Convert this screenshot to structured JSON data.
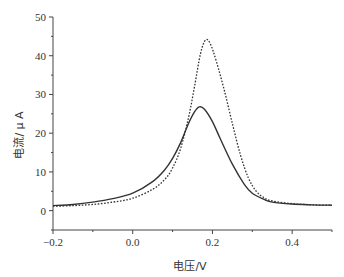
{
  "chart_data": {
    "type": "line",
    "title": "",
    "xlabel": "电压/V",
    "ylabel": "电流/ μ A",
    "xlim": [
      -0.2,
      0.5
    ],
    "ylim": [
      -5,
      50
    ],
    "grid": false,
    "legend": null,
    "x_major_ticks": [
      -0.2,
      0.0,
      0.2,
      0.4
    ],
    "x_major_tick_labels": [
      "-0.2",
      "0.0",
      "0.2",
      "0.4"
    ],
    "x_minor_ticks": [
      -0.1,
      0.1,
      0.3,
      0.5
    ],
    "y_major_ticks": [
      0,
      10,
      20,
      30,
      40,
      50
    ],
    "y_major_tick_labels": [
      "0",
      "10",
      "20",
      "30",
      "40",
      "50"
    ],
    "y_minor_ticks": [
      -5,
      5,
      15,
      25,
      35,
      45
    ],
    "series": [
      {
        "name": "solid",
        "style": "solid",
        "color": "#333333",
        "x": [
          -0.2,
          -0.15,
          -0.1,
          -0.05,
          0.0,
          0.05,
          0.08,
          0.1,
          0.12,
          0.14,
          0.155,
          0.167,
          0.18,
          0.2,
          0.22,
          0.25,
          0.28,
          0.3,
          0.33,
          0.35,
          0.4,
          0.45,
          0.5
        ],
        "y": [
          1.3,
          1.6,
          2.2,
          3.1,
          4.5,
          7.5,
          10.5,
          13.5,
          17.5,
          22.5,
          25.5,
          26.8,
          26.2,
          23.0,
          18.5,
          12.0,
          6.8,
          4.5,
          2.9,
          2.2,
          1.7,
          1.5,
          1.4
        ]
      },
      {
        "name": "dotted",
        "style": "dotted",
        "color": "#333333",
        "x": [
          -0.2,
          -0.15,
          -0.1,
          -0.05,
          0.0,
          0.05,
          0.08,
          0.1,
          0.12,
          0.14,
          0.155,
          0.17,
          0.183,
          0.195,
          0.21,
          0.23,
          0.25,
          0.27,
          0.29,
          0.31,
          0.33,
          0.35,
          0.4,
          0.45,
          0.5
        ],
        "y": [
          1.1,
          1.3,
          1.6,
          2.2,
          3.2,
          5.5,
          8.0,
          11.0,
          16.0,
          24.0,
          32.0,
          40.5,
          44.1,
          43.0,
          38.5,
          31.0,
          22.5,
          14.5,
          8.5,
          5.0,
          3.3,
          2.5,
          1.8,
          1.5,
          1.4
        ]
      }
    ]
  }
}
